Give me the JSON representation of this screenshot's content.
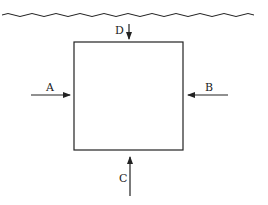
{
  "diagram": {
    "surface": {
      "name": "water-surface"
    },
    "body": {
      "name": "submerged-square"
    },
    "forces": [
      {
        "label": "A",
        "direction": "right",
        "side": "left"
      },
      {
        "label": "B",
        "direction": "left",
        "side": "right"
      },
      {
        "label": "C",
        "direction": "up",
        "side": "bottom"
      },
      {
        "label": "D",
        "direction": "down",
        "side": "top"
      }
    ],
    "colors": {
      "stroke": "#222222",
      "background": "#ffffff"
    }
  }
}
